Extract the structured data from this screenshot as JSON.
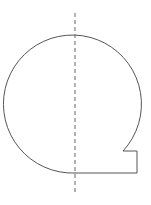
{
  "diagram": {
    "stroke_color": "#555555",
    "dash_color": "#666666",
    "shape": {
      "circle_center": [
        75,
        104
      ],
      "radius": 69,
      "notch": {
        "arc_end": [
          123,
          151
        ],
        "corner_top": [
          137,
          151
        ],
        "corner_bottom": [
          137,
          173
        ],
        "bottom_left": [
          75,
          173
        ]
      }
    },
    "axis": {
      "x": 75,
      "y_start": 13,
      "y_end": 195
    }
  }
}
